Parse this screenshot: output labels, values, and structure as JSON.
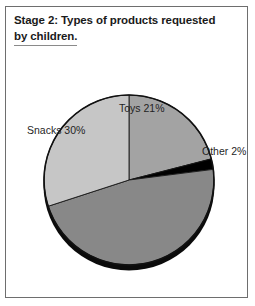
{
  "figure": {
    "title_line_1": "Stage 2: Types of products requested",
    "title_line_2": "by children.",
    "border_color": "#6e6e6e",
    "background": "#ffffff"
  },
  "chart_data": {
    "type": "pie",
    "title": "Stage 2: Types of products requested by children.",
    "xlabel": "",
    "ylabel": "",
    "legend_position": "none",
    "grid": false,
    "unit": "%",
    "total": 100,
    "categories": [
      "Toys",
      "Other",
      "Cereal",
      "Snacks"
    ],
    "values": [
      21,
      2,
      47,
      30
    ],
    "labels": [
      "Toys 21%",
      "Other 2%",
      "Cereal 47%",
      "Snacks 30%"
    ],
    "colors": [
      "#a3a3a3",
      "#000000",
      "#888888",
      "#c6c6c6"
    ],
    "slices": [
      {
        "name": "Toys",
        "value": 21,
        "label": "Toys 21%",
        "color": "#a3a3a3",
        "start_angle_deg": 0,
        "end_angle_deg": 75.6
      },
      {
        "name": "Other",
        "value": 2,
        "label": "Other 2%",
        "color": "#000000",
        "start_angle_deg": 75.6,
        "end_angle_deg": 82.8
      },
      {
        "name": "Cereal",
        "value": 47,
        "label": "Cereal 47%",
        "color": "#888888",
        "start_angle_deg": 82.8,
        "end_angle_deg": 252.0
      },
      {
        "name": "Snacks",
        "value": 30,
        "label": "Snacks 30%",
        "color": "#c6c6c6",
        "start_angle_deg": 252.0,
        "end_angle_deg": 360.0
      }
    ]
  }
}
